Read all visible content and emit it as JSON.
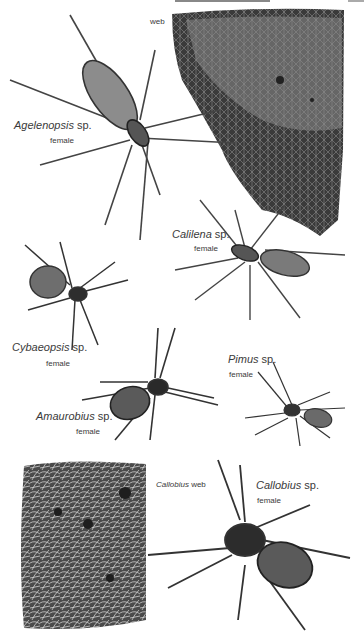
{
  "illustration": {
    "subject": "spiders plate",
    "labels": {
      "web_top": "web",
      "agelenopsis": {
        "genus": "Agelenopsis",
        "suffix": " sp.",
        "sex": "female"
      },
      "calilena": {
        "genus": "Calilena",
        "suffix": " sp.",
        "sex": "female"
      },
      "cybaeopsis": {
        "genus": "Cybaeopsis",
        "suffix": " sp.",
        "sex": "female"
      },
      "pimus": {
        "genus": "Pimus",
        "suffix": " sp.",
        "sex": "female"
      },
      "amaurobius": {
        "genus": "Amaurobius",
        "suffix": " sp.",
        "sex": "female"
      },
      "callobius_web": {
        "genus": "Callobius",
        "suffix": " web"
      },
      "callobius": {
        "genus": "Callobius",
        "suffix": " sp.",
        "sex": "female"
      }
    },
    "colors": {
      "background": "#ffffff",
      "ink": "#3a3a3a",
      "web_dark": "#2e2e2e",
      "web_light": "#cfcfcf"
    }
  }
}
